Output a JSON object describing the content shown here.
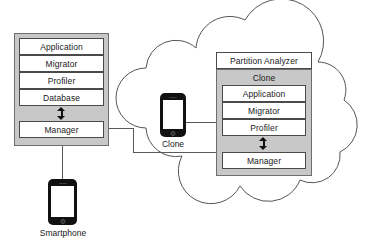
{
  "diagram": {
    "colors": {
      "module_fill": "#c8c8c8",
      "cell_fill": "#ffffff",
      "stroke": "#4a4a4a",
      "cloud_stroke": "#555555",
      "connector": "#5a5a5a",
      "phone_body": "#111111",
      "background": "#ffffff"
    }
  },
  "left_module": {
    "name": "smartphone-stack",
    "layers": [
      {
        "label": "Application"
      },
      {
        "label": "Migrator"
      },
      {
        "label": "Profiler"
      },
      {
        "label": "Database"
      }
    ],
    "arrow": {
      "type": "double-headed-vertical"
    },
    "manager": {
      "label": "Manager"
    }
  },
  "smartphone": {
    "label": "Smartphone",
    "icon": "smartphone-icon"
  },
  "cloud": {
    "name": "cloud-boundary",
    "icon": "cloud-icon"
  },
  "clone_phone": {
    "label": "Clone",
    "icon": "smartphone-icon"
  },
  "right_module": {
    "header": {
      "label": "Partition Analyzer"
    },
    "clone_header": {
      "label": "Clone"
    },
    "layers": [
      {
        "label": "Application"
      },
      {
        "label": "Migrator"
      },
      {
        "label": "Profiler"
      }
    ],
    "arrow": {
      "type": "double-headed-vertical"
    },
    "manager": {
      "label": "Manager"
    }
  },
  "connectors": [
    {
      "from": "left-manager",
      "to": "right-manager"
    },
    {
      "from": "clone-phone",
      "to": "right-profiler"
    },
    {
      "from": "left-manager",
      "to": "smartphone"
    }
  ]
}
